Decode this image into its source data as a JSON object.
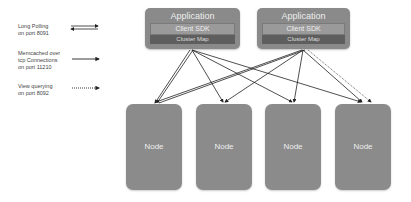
{
  "legend": [
    {
      "label_lines": [
        "Long Polling",
        "on port 8091"
      ],
      "style": "double-arrow"
    },
    {
      "label_lines": [
        "Memcached over",
        "tcp Connections",
        "on port 11210"
      ],
      "style": "solid-arrow"
    },
    {
      "label_lines": [
        "View querying",
        "on port 8092"
      ],
      "style": "dotted-arrow"
    }
  ],
  "apps": [
    {
      "title": "Application",
      "sdk": "Client SDK",
      "cluster_map": "Cluster Map"
    },
    {
      "title": "Application",
      "sdk": "Client SDK",
      "cluster_map": "Cluster Map"
    }
  ],
  "nodes": [
    {
      "label": "Node"
    },
    {
      "label": "Node"
    },
    {
      "label": "Node"
    },
    {
      "label": "Node"
    }
  ],
  "colors": {
    "box": "#8a8a8a",
    "cluster_map": "#5e5e5e",
    "arrow": "#222222"
  }
}
